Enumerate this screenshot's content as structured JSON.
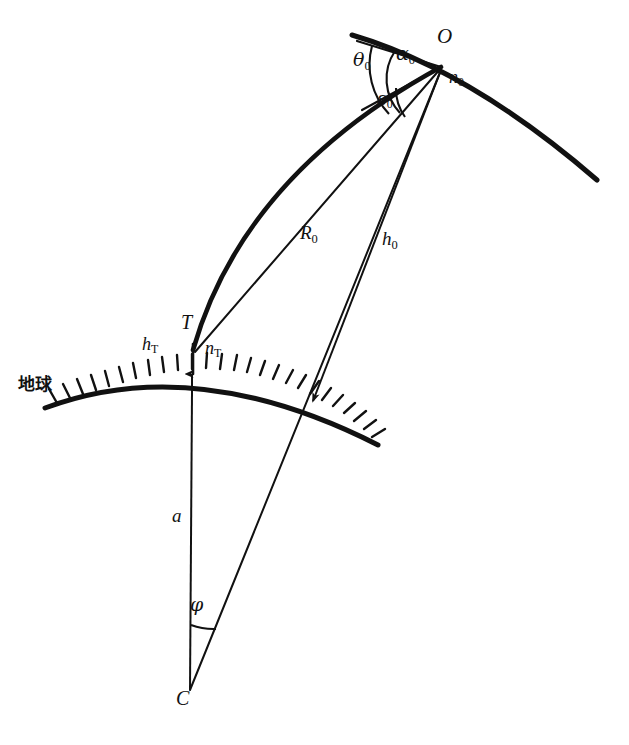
{
  "figure": {
    "title": "",
    "background": "#ffffff",
    "ink_color": "#111111",
    "width": 629,
    "height": 745
  },
  "labels": {
    "earth": {
      "text": "地球",
      "x": 18,
      "y": 385,
      "size": 17
    },
    "point_O": {
      "base": "O",
      "x": 437,
      "y": 36,
      "size": 21
    },
    "point_T": {
      "base": "T",
      "x": 181,
      "y": 322,
      "size": 20
    },
    "point_C": {
      "base": "C",
      "x": 176,
      "y": 697,
      "size": 20
    },
    "n_zero": {
      "base": "n",
      "sub": "0",
      "x": 449,
      "y": 78,
      "size": 18
    },
    "n_T": {
      "base": "n",
      "sub": "T",
      "x": 205,
      "y": 348,
      "size": 18
    },
    "h_T": {
      "base": "h",
      "sub": "T",
      "x": 142,
      "y": 344,
      "size": 18
    },
    "h_zero": {
      "base": "h",
      "sub": "0",
      "x": 382,
      "y": 238,
      "size": 19
    },
    "R_zero": {
      "base": "R",
      "sub": "0",
      "x": 300,
      "y": 233,
      "size": 19
    },
    "a_radius": {
      "base": "a",
      "x": 172,
      "y": 515,
      "size": 19
    },
    "theta_zero": {
      "base": "θ",
      "sub": "0",
      "x": 353,
      "y": 60,
      "size": 19
    },
    "alpha_zero": {
      "base": "α",
      "sub": "0",
      "x": 396,
      "y": 54,
      "size": 19
    },
    "epsilon_zero": {
      "base": "ε",
      "sub": "0",
      "x": 377,
      "y": 99,
      "size": 18
    },
    "phi_centre": {
      "base": "φ",
      "x": 190,
      "y": 604,
      "size": 19
    }
  },
  "geometry": {
    "earth_centre": {
      "x": 190,
      "y": 690
    },
    "target_T": {
      "x": 193,
      "y": 350
    },
    "observation_O": {
      "x": 441,
      "y": 67
    },
    "earth_surface_at_T": {
      "x": 192,
      "y": 379
    },
    "earth_arc_left_end": {
      "x": 45,
      "y": 408
    },
    "earth_arc_right_end": {
      "x": 378,
      "y": 445
    },
    "orbit_arc_left_end": {
      "x": 352,
      "y": 35
    },
    "orbit_arc_right_end": {
      "x": 597,
      "y": 180
    },
    "tangent_line_left_end": {
      "x": 357,
      "y": 41
    },
    "h0_ground_arrow_tip": {
      "x": 311,
      "y": 403
    },
    "epsilon_ray_left_end": {
      "x": 362,
      "y": 110
    },
    "hatch_count": 26
  }
}
